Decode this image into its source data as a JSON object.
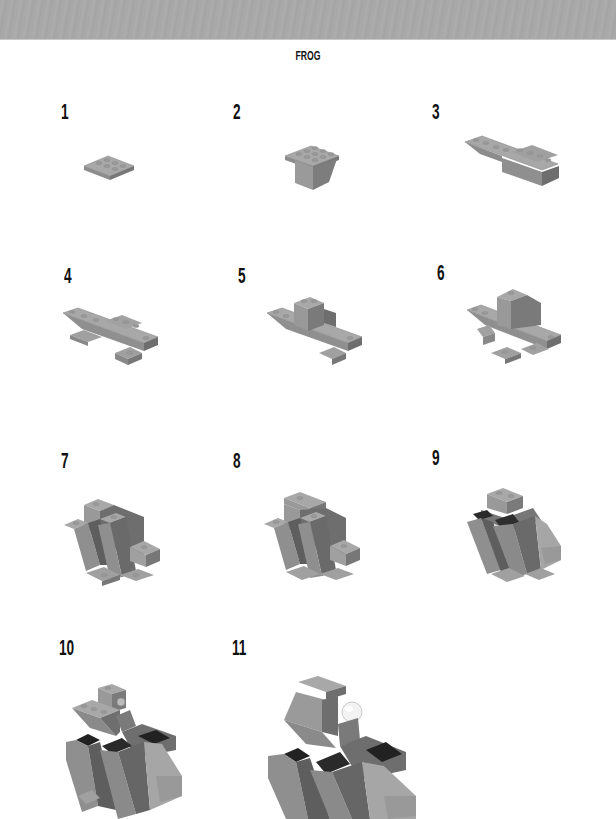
{
  "page": {
    "title": "FROG"
  },
  "steps": [
    {
      "number": "1",
      "figure": "step-1-figure"
    },
    {
      "number": "2",
      "figure": "step-2-figure"
    },
    {
      "number": "3",
      "figure": "step-3-figure"
    },
    {
      "number": "4",
      "figure": "step-4-figure"
    },
    {
      "number": "5",
      "figure": "step-5-figure"
    },
    {
      "number": "6",
      "figure": "step-6-figure"
    },
    {
      "number": "7",
      "figure": "step-7-figure"
    },
    {
      "number": "8",
      "figure": "step-8-figure"
    },
    {
      "number": "9",
      "figure": "step-9-figure"
    },
    {
      "number": "10",
      "figure": "step-10-figure"
    },
    {
      "number": "11",
      "figure": "step-11-figure"
    }
  ],
  "colors": {
    "header_band": "#a9a9a9",
    "brick_light": "#a8a8a8",
    "brick_mid": "#8c8c8c",
    "brick_dark": "#6e6e6e",
    "brick_black": "#2a2a2a",
    "eye": "#f2f2f2"
  }
}
